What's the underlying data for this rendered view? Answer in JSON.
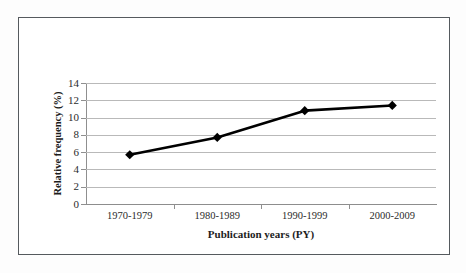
{
  "figure": {
    "border_color": "#555a5e",
    "background": "#ffffff"
  },
  "chart_data": {
    "type": "line",
    "title": "",
    "subtitle": "",
    "xlabel": "Publication years (PY)",
    "ylabel": "Relative frequency (%)",
    "categories": [
      "1970-1979",
      "1980-1989",
      "1990-1999",
      "2000-2009"
    ],
    "values": [
      5.7,
      7.7,
      10.8,
      11.4
    ],
    "series": [
      {
        "name": "Relative frequency",
        "values": [
          5.7,
          7.7,
          10.8,
          11.4
        ],
        "line_color": "#000000",
        "marker": "diamond",
        "marker_color": "#000000"
      }
    ],
    "ylim": [
      0,
      14
    ],
    "yticks": [
      0,
      2,
      4,
      6,
      8,
      10,
      12,
      14
    ],
    "ytick_labels": [
      "0",
      "2",
      "4",
      "6",
      "8",
      "10",
      "12",
      "14"
    ],
    "grid": {
      "horizontal": true,
      "vertical": false,
      "color": "#b9b9b9"
    },
    "legend": {
      "visible": false,
      "position": "none"
    },
    "axis_color": "#8f8f8f"
  }
}
